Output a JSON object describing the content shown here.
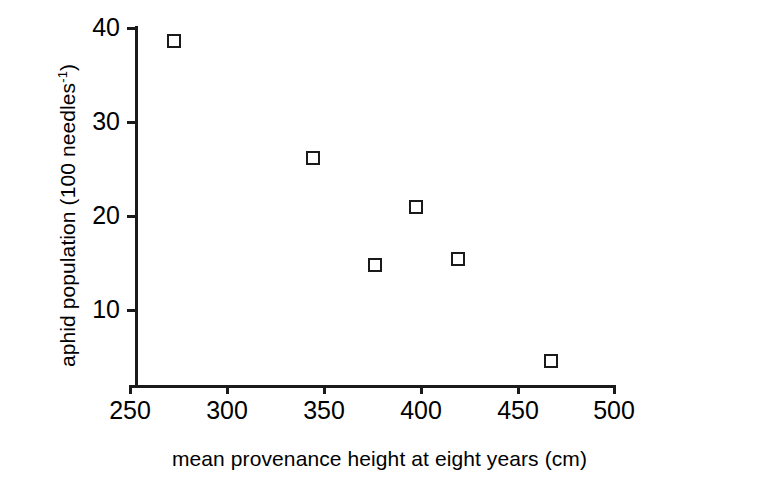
{
  "chart_data": {
    "type": "scatter",
    "title": "",
    "xlabel": "mean provenance height at eight years (cm)",
    "ylabel_text": "aphid population (100 needles",
    "ylabel_sup": "-1",
    "ylabel_tail": ")",
    "ylabel_full": "aphid population (100 needles-1)",
    "xlim": [
      250,
      500
    ],
    "ylim": [
      0,
      40
    ],
    "xticks": [
      250,
      300,
      350,
      400,
      450,
      500
    ],
    "yticks": [
      10,
      20,
      30,
      40
    ],
    "xtick_labels": [
      "250",
      "300",
      "350",
      "400",
      "450",
      "500"
    ],
    "ytick_labels": [
      "10",
      "20",
      "30",
      "40"
    ],
    "grid": false,
    "legend": null,
    "marker_style": "open-square",
    "marker_color": "#1a1a1a",
    "points": [
      {
        "x": 273,
        "y": 38.5,
        "label": "point-1"
      },
      {
        "x": 345,
        "y": 26.1,
        "label": "point-2"
      },
      {
        "x": 377,
        "y": 14.7,
        "label": "point-3"
      },
      {
        "x": 398,
        "y": 20.8,
        "label": "point-4"
      },
      {
        "x": 420,
        "y": 15.3,
        "label": "point-5"
      },
      {
        "x": 468,
        "y": 4.5,
        "label": "point-6"
      }
    ]
  }
}
